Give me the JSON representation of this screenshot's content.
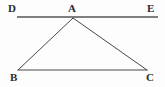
{
  "figure": {
    "background_color": "#fdfdfd",
    "stroke_color": "#333333",
    "line_de_color": "#555555"
  },
  "labels": {
    "d": "D",
    "a": "A",
    "e": "E",
    "b": "B",
    "c": "C"
  },
  "chart_data": {
    "type": "diagram",
    "points": [
      {
        "name": "D",
        "x": 17,
        "y": 17
      },
      {
        "name": "A",
        "x": 73,
        "y": 18
      },
      {
        "name": "E",
        "x": 158,
        "y": 17
      },
      {
        "name": "B",
        "x": 18,
        "y": 70
      },
      {
        "name": "C",
        "x": 147,
        "y": 70
      }
    ],
    "segments": [
      {
        "name": "DE",
        "from": "D",
        "to": "E"
      },
      {
        "name": "AB",
        "from": "A",
        "to": "B"
      },
      {
        "name": "AC",
        "from": "A",
        "to": "C"
      },
      {
        "name": "BC",
        "from": "B",
        "to": "C"
      }
    ],
    "xlim": [
      0,
      165
    ],
    "ylim": [
      0,
      87
    ]
  }
}
